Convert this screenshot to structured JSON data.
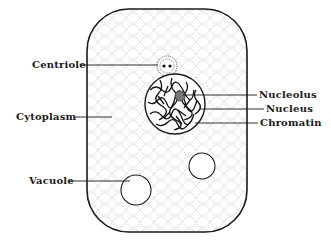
{
  "diagram": {
    "colors": {
      "outline": "#1a1a1a",
      "cytoplasm_dots": "#8a8a8a",
      "background": "#ffffff",
      "chromatin": "#111111"
    },
    "labels": {
      "centriole": "Centriole",
      "cytoplasm": "Cytoplasm",
      "vacuole": "Vacuole",
      "nucleolus": "Nucleolus",
      "nucleus": "Nucleus",
      "chromatin": "Chromatin"
    },
    "parts": [
      {
        "name": "Centriole",
        "side": "left"
      },
      {
        "name": "Cytoplasm",
        "side": "left"
      },
      {
        "name": "Vacuole",
        "side": "left"
      },
      {
        "name": "Nucleolus",
        "side": "right"
      },
      {
        "name": "Nucleus",
        "side": "right"
      },
      {
        "name": "Chromatin",
        "side": "right"
      }
    ]
  }
}
